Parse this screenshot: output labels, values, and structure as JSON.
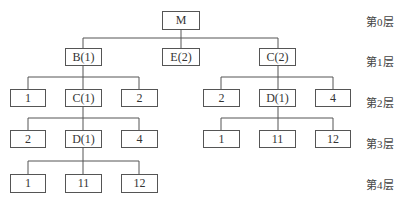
{
  "levels": [
    "第0层",
    "第1层",
    "第2层",
    "第3层",
    "第4层"
  ],
  "tree": {
    "root": "M",
    "level1": [
      "B(1)",
      "E(2)",
      "C(2)"
    ],
    "left_level2": [
      "1",
      "C(1)",
      "2"
    ],
    "left_level3": [
      "2",
      "D(1)",
      "4"
    ],
    "left_level4": [
      "1",
      "11",
      "12"
    ],
    "right_level2": [
      "2",
      "D(1)",
      "4"
    ],
    "right_level3": [
      "1",
      "11",
      "12"
    ]
  }
}
